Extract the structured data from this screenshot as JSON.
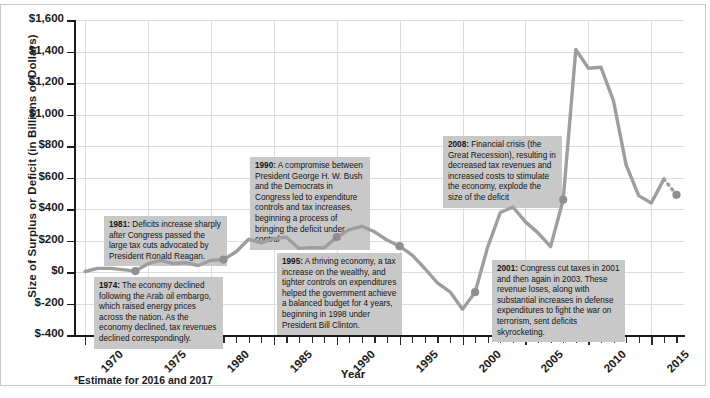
{
  "chart_data": {
    "type": "line",
    "title": "",
    "xlabel": "Year",
    "ylabel": "Size of Surplus or Deficit (in Billions of Dollars)",
    "footnote": "*Estimate for 2016 and 2017",
    "xlim": [
      1969.2,
      2017.6
    ],
    "ylim": [
      -400,
      1600
    ],
    "ytick_labels": [
      "$1,600",
      "$1,400",
      "$1,200",
      "$1,000",
      "$800",
      "$600",
      "$400",
      "$200",
      "$0",
      "$-200",
      "$-400"
    ],
    "ytick_values": [
      1600,
      1400,
      1200,
      1000,
      800,
      600,
      400,
      200,
      0,
      -200,
      -400
    ],
    "xtick_labels": [
      "1970",
      "1975",
      "1980",
      "1985",
      "1990",
      "1995",
      "2000",
      "2005",
      "2010",
      "2015"
    ],
    "xtick_values": [
      1970,
      1975,
      1980,
      1985,
      1990,
      1995,
      2000,
      2005,
      2010,
      2015
    ],
    "xtick_minor_step": 1,
    "grid": true,
    "legend": "none",
    "line_color": "#9e9e9e",
    "marker_color": "#8f8f8f",
    "series_name": "Federal budget deficit",
    "x": [
      1970,
      1971,
      1972,
      1973,
      1974,
      1975,
      1976,
      1977,
      1978,
      1979,
      1980,
      1981,
      1982,
      1983,
      1984,
      1985,
      1986,
      1987,
      1988,
      1989,
      1990,
      1991,
      1992,
      1993,
      1994,
      1995,
      1996,
      1997,
      1998,
      1999,
      2000,
      2001,
      2002,
      2003,
      2004,
      2005,
      2006,
      2007,
      2008,
      2009,
      2010,
      2011,
      2012,
      2013,
      2014,
      2015,
      2016,
      2017
    ],
    "values": [
      3,
      23,
      23,
      15,
      6,
      53,
      74,
      54,
      59,
      41,
      74,
      79,
      128,
      208,
      185,
      212,
      221,
      150,
      155,
      153,
      221,
      269,
      290,
      255,
      203,
      164,
      107,
      22,
      -69,
      -126,
      -236,
      -128,
      158,
      378,
      413,
      318,
      248,
      161,
      459,
      1413,
      1294,
      1300,
      1087,
      680,
      485,
      438,
      590,
      490
    ],
    "estimate_from": 2016,
    "estimate_note": "dashed segment = 2016 and 2017 estimate",
    "markers": [
      {
        "year": 1974,
        "value": 6,
        "note_ref": "1974"
      },
      {
        "year": 1981,
        "value": 79,
        "note_ref": "1981"
      },
      {
        "year": 1990,
        "value": 221,
        "note_ref": "1990"
      },
      {
        "year": 1995,
        "value": 164,
        "note_ref": "1995"
      },
      {
        "year": 2001,
        "value": -128,
        "note_ref": "2001"
      },
      {
        "year": 2008,
        "value": 459,
        "note_ref": "2008"
      },
      {
        "year": 2017,
        "value": 490,
        "note_ref": "estimate"
      }
    ]
  },
  "annotations": [
    {
      "id": "n1974",
      "year": "1974",
      "text": "The economy declined following the Arab oil embargo, which raised energy prices across the nation. As the economy declined, tax revenues declined correspondingly."
    },
    {
      "id": "n1981",
      "year": "1981",
      "text": "Deficits increase sharply after Congress passed the large tax cuts advocated by President Ronald Reagan."
    },
    {
      "id": "n1990",
      "year": "1990",
      "text": "A compromise between President George H. W. Bush and the Democrats in Congress led to expenditure controls and tax increases, beginning a process of bringing the deficit under control"
    },
    {
      "id": "n1995",
      "year": "1995",
      "text": "A thriving economy, a tax increase on the wealthy, and tighter controls on expenditures helped the government achieve a balanced budget for 4 years, beginning in 1998 under President Bill Clinton."
    },
    {
      "id": "n2001",
      "year": "2001",
      "text": "Congress cut taxes in 2001 and then again in 2003. These revenue loses, along with substantial increases in defense expenditures to fight the war on terrorism, sent deficits skyrocketing."
    },
    {
      "id": "n2008",
      "year": "2008",
      "text": "Financial crisis (the Great Recession), resulting in decreased tax revenues and increased costs to stimulate the economy, explode the size of the deficit"
    }
  ]
}
